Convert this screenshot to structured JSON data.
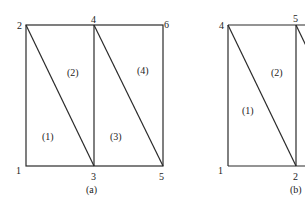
{
  "colors": {
    "line": "#2a2a2a",
    "text": "#222222",
    "background": "#ffffff"
  },
  "diagram_a": {
    "caption": "(a)",
    "nodes": [
      {
        "id": "1",
        "label": "1",
        "x": 26,
        "y": 166,
        "lx": 19,
        "ly": 174
      },
      {
        "id": "2",
        "label": "2",
        "x": 26,
        "y": 25,
        "lx": 18,
        "ly": 29
      },
      {
        "id": "3",
        "label": "3",
        "x": 94,
        "y": 166,
        "lx": 92,
        "ly": 179
      },
      {
        "id": "4",
        "label": "4",
        "x": 94,
        "y": 25,
        "lx": 91,
        "ly": 23
      },
      {
        "id": "5",
        "label": "5",
        "x": 163,
        "y": 166,
        "lx": 159,
        "ly": 179
      },
      {
        "id": "6",
        "label": "6",
        "x": 163,
        "y": 25,
        "lx": 165,
        "ly": 27
      }
    ],
    "elements": [
      {
        "label": "(1)",
        "x": 48,
        "y": 140
      },
      {
        "label": "(2)",
        "x": 73,
        "y": 75
      },
      {
        "label": "(3)",
        "x": 117,
        "y": 140
      },
      {
        "label": "(4)",
        "x": 143,
        "y": 73
      }
    ]
  },
  "diagram_b": {
    "caption": "(b)",
    "nodes": [
      {
        "id": "1",
        "label": "1",
        "x": 228,
        "y": 166,
        "lx": 219,
        "ly": 174
      },
      {
        "id": "2",
        "label": "2",
        "x": 296,
        "y": 166,
        "lx": 294,
        "ly": 179
      },
      {
        "id": "4",
        "label": "4",
        "x": 228,
        "y": 25,
        "lx": 219,
        "ly": 29
      },
      {
        "id": "5",
        "label": "5",
        "x": 296,
        "y": 25,
        "lx": 294,
        "ly": 23
      }
    ],
    "elements": [
      {
        "label": "(1)",
        "x": 248,
        "y": 113
      },
      {
        "label": "(2)",
        "x": 277,
        "y": 75
      }
    ]
  }
}
